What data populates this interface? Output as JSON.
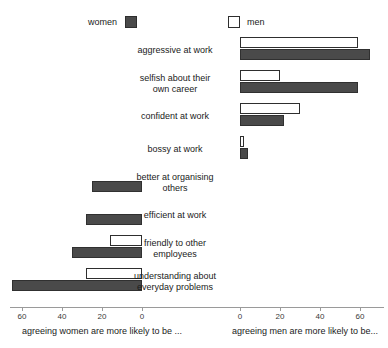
{
  "legend": {
    "women": {
      "label": "women",
      "swatch": "filled-dark-square",
      "color": "#4a4a4a"
    },
    "men": {
      "label": "men",
      "swatch": "empty-white-square",
      "color": "#ffffff"
    }
  },
  "axes": {
    "left": {
      "title": "agreeing women are more likely to be ...",
      "ticks": [
        60,
        40,
        20,
        0
      ]
    },
    "right": {
      "title": "agreeing men are more likely to be...",
      "ticks": [
        0,
        20,
        40,
        60
      ]
    }
  },
  "chart_data": {
    "type": "bar",
    "orientation": "horizontal-diverging",
    "title": "",
    "subtitle": "",
    "xlabel_left": "agreeing women are more likely to be ...",
    "xlabel_right": "agreeing men are more likely to be...",
    "ylabel": "",
    "xlim_left": [
      0,
      60
    ],
    "xlim_right": [
      0,
      60
    ],
    "grid": false,
    "legend_position": "top",
    "categories": [
      "aggressive at work",
      "selfish about their own career",
      "confident at work",
      "bossy at work",
      "better at organising others",
      "efficient at work",
      "friendly to other employees",
      "understanding about everyday problems"
    ],
    "series": [
      {
        "name": "women",
        "color": "#4a4a4a",
        "values": [
          -65,
          -59,
          -22,
          -4,
          25,
          28,
          35,
          65
        ]
      },
      {
        "name": "men",
        "color": "#ffffff",
        "values": [
          -59,
          -20,
          -30,
          -2,
          0,
          0,
          16,
          28
        ]
      }
    ]
  },
  "rows": [
    {
      "label": "aggressive at work",
      "side": "right",
      "women": 65,
      "men": 59
    },
    {
      "label": "selfish about their\nown career",
      "side": "right",
      "women": 59,
      "men": 20
    },
    {
      "label": "confident at work",
      "side": "right",
      "women": 22,
      "men": 30
    },
    {
      "label": "bossy at work",
      "side": "right",
      "women": 4,
      "men": 2
    },
    {
      "label": "better at organising\nothers",
      "side": "left",
      "women": 25,
      "men": 0
    },
    {
      "label": "efficient at work",
      "side": "left",
      "women": 28,
      "men": 0
    },
    {
      "label": "friendly to other\nemployees",
      "side": "left",
      "women": 35,
      "men": 16
    },
    {
      "label": "understanding about\neveryday problems",
      "side": "left",
      "women": 65,
      "men": 28
    }
  ]
}
